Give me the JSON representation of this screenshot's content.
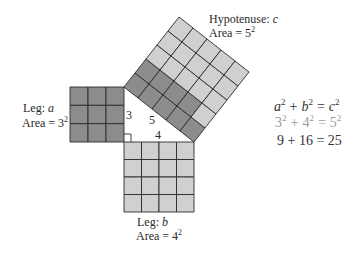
{
  "diagram": {
    "colors": {
      "dark_cell": "#8c8c8c",
      "light_cell": "#d0d0d0",
      "grid_line": "#2a2a2a",
      "text": "#2a2a2a",
      "muted_text": "#9a9a9a"
    },
    "squares": {
      "leg_a": {
        "label_prefix": "Leg: ",
        "label_var": "a",
        "area_prefix": "Area = 3",
        "area_exp": "2",
        "side": 3
      },
      "leg_b": {
        "label_prefix": "Leg: ",
        "label_var": "b",
        "area_prefix": "Area = 4",
        "area_exp": "2",
        "side": 4
      },
      "hypotenuse": {
        "label_prefix": "Hypotenuse: ",
        "label_var": "c",
        "area_prefix": "Area = 5",
        "area_exp": "2",
        "side": 5,
        "dark_cells": 9,
        "light_cells": 16
      }
    },
    "triangle_sides": {
      "a": "3",
      "b": "4",
      "c": "5"
    },
    "equations": {
      "line1": {
        "a": "a",
        "b": "b",
        "c": "c",
        "exp": "2",
        "plus": "+",
        "equals": "="
      },
      "line2": {
        "a": "3",
        "b": "4",
        "c": "5",
        "exp": "2",
        "plus": "+",
        "equals": "="
      },
      "line3": {
        "text": "9 + 16 = 25"
      }
    }
  }
}
